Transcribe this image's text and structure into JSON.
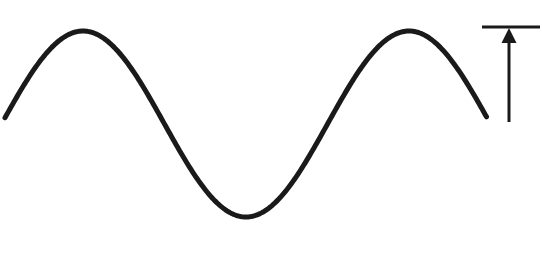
{
  "figure": {
    "background_color": "#ffffff",
    "width": 542,
    "height": 255,
    "caption": ""
  },
  "chart_data": {
    "type": "line",
    "title": "",
    "subtitle": "",
    "xlabel": "",
    "ylabel": "",
    "grid": false,
    "legend": false,
    "axes_visible": false,
    "tick_labels_x": [],
    "tick_labels_y": [],
    "xlim": [
      0,
      542
    ],
    "ylim": [
      255,
      0
    ],
    "series": [
      {
        "name": "sine-wave",
        "stroke_color": "#1a1a1a",
        "stroke_width": 5,
        "waveform": "sine",
        "midline_y": 124,
        "amplitude_px": 93,
        "wavelength_px": 326,
        "x_start": 5,
        "x_end": 487,
        "phase_note": "rises from left edge to first crest, one full cycle, ends descending at right edge",
        "x": [
          5,
          20,
          40,
          60,
          83,
          105,
          130,
          150,
          167,
          190,
          215,
          235,
          252,
          270,
          290,
          310,
          330,
          352,
          375,
          395,
          408,
          430,
          455,
          470,
          487
        ],
        "y": [
          122,
          88,
          55,
          37,
          31,
          36,
          58,
          94,
          124,
          163,
          198,
          213,
          217,
          213,
          197,
          161,
          124,
          86,
          50,
          34,
          31,
          41,
          77,
          100,
          122
        ],
        "key_points": [
          {
            "label": "left-end",
            "x": 5,
            "y": 122
          },
          {
            "label": "crest-1",
            "x": 83,
            "y": 31
          },
          {
            "label": "descending-midline-crossing",
            "x": 167,
            "y": 124
          },
          {
            "label": "trough",
            "x": 252,
            "y": 217
          },
          {
            "label": "ascending-midline-crossing",
            "x": 330,
            "y": 124
          },
          {
            "label": "crest-2",
            "x": 408,
            "y": 31
          },
          {
            "label": "right-end",
            "x": 487,
            "y": 122
          }
        ]
      }
    ],
    "annotations": [
      {
        "name": "reference-bar",
        "type": "horizontal-line",
        "color": "#1a1a1a",
        "x1": 482,
        "x2": 540,
        "y": 27,
        "thickness": 3,
        "text": ""
      },
      {
        "name": "amplitude-arrow",
        "type": "arrow",
        "color": "#1a1a1a",
        "direction": "up",
        "x": 509,
        "y_tail": 122,
        "y_tip": 28,
        "shaft_width": 3,
        "head_width": 15,
        "head_height": 15,
        "text": ""
      }
    ]
  },
  "colors": {
    "ink": "#1a1a1a",
    "background": "#ffffff"
  }
}
